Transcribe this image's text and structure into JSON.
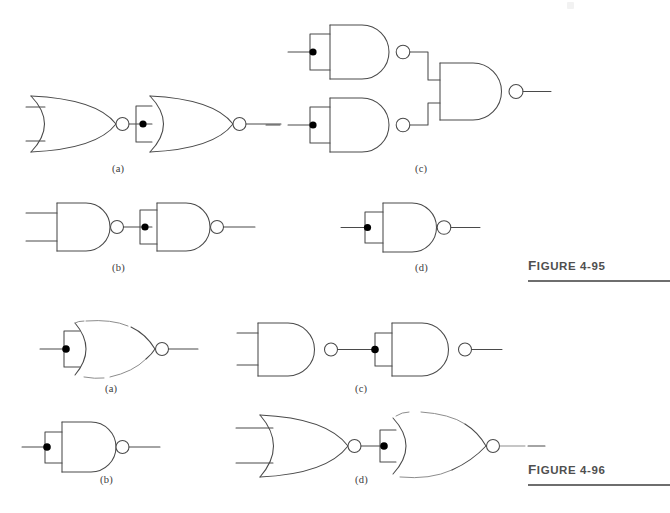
{
  "page": {
    "width": 670,
    "height": 513,
    "background": "#ffffff",
    "ink_color": "#4a4a4a",
    "caption_color": "#4f4f4f"
  },
  "figures": [
    {
      "id": "figure-4-95",
      "caption_word": "Figure",
      "caption_number": "4-95",
      "caption_full": "FIGURE 4-95",
      "caption_x": 528,
      "caption_y": 258,
      "rule_x": 528,
      "rule_y": 280,
      "rule_width": 142,
      "parts": [
        {
          "key": "a",
          "label": "(a)",
          "label_x": 112,
          "label_y": 163,
          "description": "Two cascaded NOR gates; second NOR has its two inputs tied together through a bracket with a junction dot",
          "gates": [
            {
              "type": "NOR",
              "inputs": 2,
              "tied_inputs": false
            },
            {
              "type": "NOR",
              "inputs": 2,
              "tied_inputs": true
            }
          ]
        },
        {
          "key": "b",
          "label": "(b)",
          "label_x": 112,
          "label_y": 262,
          "description": "Two cascaded NAND gates; second NAND has its two inputs tied together through a bracket with a junction dot",
          "gates": [
            {
              "type": "NAND",
              "inputs": 2,
              "tied_inputs": false
            },
            {
              "type": "NAND",
              "inputs": 2,
              "tied_inputs": true
            }
          ]
        },
        {
          "key": "c",
          "label": "(c)",
          "label_x": 415,
          "label_y": 163,
          "description": "Two NAND gates with tied inputs feeding a third NAND gate",
          "gates": [
            {
              "type": "NAND",
              "inputs": 2,
              "tied_inputs": true
            },
            {
              "type": "NAND",
              "inputs": 2,
              "tied_inputs": true
            },
            {
              "type": "NAND",
              "inputs": 2,
              "tied_inputs": false
            }
          ]
        },
        {
          "key": "d",
          "label": "(d)",
          "label_x": 415,
          "label_y": 262,
          "description": "Single NAND gate with its two inputs tied together",
          "gates": [
            {
              "type": "NAND",
              "inputs": 2,
              "tied_inputs": true
            }
          ]
        }
      ]
    },
    {
      "id": "figure-4-96",
      "caption_word": "Figure",
      "caption_number": "4-96",
      "caption_full": "FIGURE 4-96",
      "caption_x": 528,
      "caption_y": 462,
      "rule_x": 528,
      "rule_y": 484,
      "rule_width": 142,
      "parts": [
        {
          "key": "a",
          "label": "(a)",
          "label_x": 105,
          "label_y": 383,
          "description": "Single NOR gate with its two inputs tied together (inverter equivalent)",
          "gates": [
            {
              "type": "NOR",
              "inputs": 2,
              "tied_inputs": true
            }
          ]
        },
        {
          "key": "b",
          "label": "(b)",
          "label_x": 100,
          "label_y": 474,
          "description": "Single NAND gate with its two inputs tied together (inverter equivalent)",
          "gates": [
            {
              "type": "NAND",
              "inputs": 2,
              "tied_inputs": true
            }
          ]
        },
        {
          "key": "c",
          "label": "(c)",
          "label_x": 355,
          "label_y": 383,
          "description": "NAND gate feeding a second NAND gate whose inputs are tied together",
          "gates": [
            {
              "type": "NAND",
              "inputs": 2,
              "tied_inputs": false
            },
            {
              "type": "NAND",
              "inputs": 2,
              "tied_inputs": true
            }
          ]
        },
        {
          "key": "d",
          "label": "(d)",
          "label_x": 355,
          "label_y": 474,
          "description": "NOR gate feeding a second NOR gate whose inputs are tied together",
          "gates": [
            {
              "type": "NOR",
              "inputs": 2,
              "tied_inputs": false
            },
            {
              "type": "NOR",
              "inputs": 2,
              "tied_inputs": true
            }
          ]
        }
      ]
    }
  ]
}
